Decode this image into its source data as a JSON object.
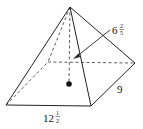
{
  "diagram": {
    "type": "square-based pyramid",
    "labels": {
      "height": {
        "whole": "6",
        "num": "2",
        "den": "5"
      },
      "base_length": {
        "whole": "12",
        "num": "1",
        "den": "2"
      },
      "base_width": "9"
    },
    "colors": {
      "line": "#222222",
      "background": "#ffffff"
    }
  }
}
